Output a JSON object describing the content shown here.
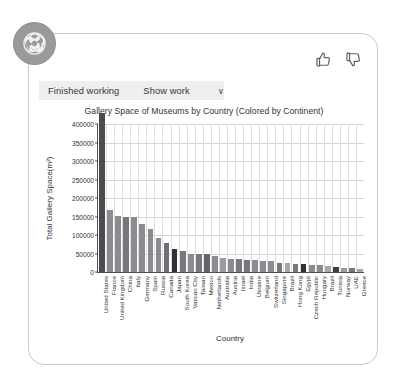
{
  "avatar": {
    "icon": "openai-logo-icon"
  },
  "feedback": {
    "thumbs_up": "thumbs-up-icon",
    "thumbs_down": "thumbs-down-icon"
  },
  "work_bar": {
    "status": "Finished working",
    "show_work": "Show work",
    "chevron": "∨"
  },
  "chart_data": {
    "type": "bar",
    "title": "Gallery Space of Museums by Country (Colored by Continent)",
    "xlabel": "Country",
    "ylabel": "Total Gallery Space(m²)",
    "ylim": [
      0,
      400000
    ],
    "yticks": [
      0,
      50000,
      100000,
      150000,
      200000,
      250000,
      300000,
      350000,
      400000
    ],
    "ytick_labels": [
      "0",
      "50000",
      "100000",
      "150000",
      "200000",
      "250000",
      "300000",
      "350000",
      "400000"
    ],
    "grid": true,
    "legend": "none",
    "colored_by": "Continent",
    "categories": [
      "United States",
      "France",
      "United Kingdom",
      "China",
      "Italy",
      "Germany",
      "Spain",
      "Russia",
      "Canada",
      "Japan",
      "South Korea",
      "Vatican City",
      "Taiwan",
      "Mexico",
      "Netherlands",
      "Australia",
      "Austria",
      "Israel",
      "India",
      "Ukraine",
      "Belgium",
      "Switzerland",
      "Singapore",
      "Brazil",
      "Hong Kong",
      "Egypt",
      "Czech Republic",
      "Hungary",
      "Brazil",
      "Tunisia",
      "Norway",
      "UAE",
      "Greece"
    ],
    "values": [
      430000,
      168000,
      152000,
      150000,
      148000,
      130000,
      115000,
      92000,
      78000,
      62000,
      58000,
      50000,
      49000,
      48000,
      42000,
      38000,
      36000,
      34000,
      33000,
      32000,
      31000,
      30000,
      25000,
      24000,
      23000,
      22000,
      20000,
      19000,
      16000,
      14000,
      12000,
      11000,
      9000
    ],
    "bar_colors": [
      "#4a4c50",
      "#8a8c90",
      "#8a8c90",
      "#76787c",
      "#8a8c90",
      "#8a8c90",
      "#8a8c90",
      "#8a8c90",
      "#6e7074",
      "#2f3134",
      "#76787c",
      "#8a8c90",
      "#76787c",
      "#62646a",
      "#8a8c90",
      "#9a9ca0",
      "#8a8c90",
      "#76787c",
      "#76787c",
      "#8a8c90",
      "#8a8c90",
      "#8a8c90",
      "#76787c",
      "#a5a7ab",
      "#76787c",
      "#2f3134",
      "#8a8c90",
      "#8a8c90",
      "#a5a7ab",
      "#3a3c40",
      "#9a9ca0",
      "#76787c",
      "#a5a7ab"
    ]
  }
}
